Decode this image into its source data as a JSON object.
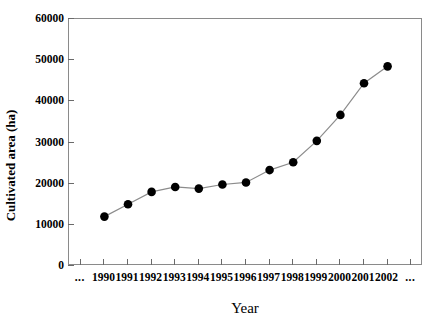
{
  "chart_data": {
    "type": "line",
    "title": "",
    "xlabel": "Year",
    "ylabel": "Cultivated area (ha)",
    "categories": [
      "1990",
      "1991",
      "1992",
      "1993",
      "1994",
      "1995",
      "1996",
      "1997",
      "1998",
      "1999",
      "2000",
      "2001",
      "2002"
    ],
    "values": [
      12000,
      15000,
      18000,
      19200,
      18800,
      19800,
      20300,
      23300,
      25200,
      30400,
      36700,
      44400,
      48500
    ],
    "series": [
      {
        "name": "Cultivated area",
        "values": [
          12000,
          15000,
          18000,
          19200,
          18800,
          19800,
          20300,
          23300,
          25200,
          30400,
          36700,
          44400,
          48500
        ]
      }
    ],
    "ylim": [
      0,
      60000
    ],
    "yticks": [
      0,
      10000,
      20000,
      30000,
      40000,
      50000,
      60000
    ],
    "ytick_labels": [
      "0",
      "10000",
      "20000",
      "30000",
      "40000",
      "50000",
      "60000"
    ],
    "xtick_labels": [
      "...",
      "1990",
      "1991",
      "1992",
      "1993",
      "1994",
      "1995",
      "1996",
      "1997",
      "1998",
      "1999",
      "2000",
      "2001",
      "2002",
      "..."
    ],
    "grid": false,
    "legend": false,
    "marker": "filled-circle",
    "marker_color": "#000000",
    "line_color": "#8c8c8c",
    "axis_color": "#8a8a8a",
    "leading_ellipsis": "...",
    "trailing_ellipsis": "..."
  }
}
